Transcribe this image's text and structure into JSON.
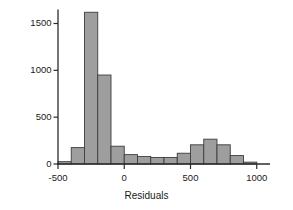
{
  "chart_data": {
    "type": "bar",
    "title": "",
    "xlabel": "Residuals",
    "ylabel": "Frequency",
    "xlim": [
      -500,
      1100
    ],
    "ylim": [
      0,
      1700
    ],
    "grid": false,
    "legend": null,
    "bin_width": 100,
    "bar_color": "#9e9e9e",
    "bar_edge_color": "#3d3d3d",
    "axis_color": "#2b2b2b",
    "xticks": [
      -500,
      0,
      500,
      1000
    ],
    "xtick_labels": [
      "-500",
      "0",
      "500",
      "1000"
    ],
    "yticks": [
      0,
      500,
      1000,
      1500
    ],
    "ytick_labels": [
      "0",
      "500",
      "1000",
      "1500"
    ],
    "bins": [
      {
        "x0": -500,
        "x1": -400,
        "value": 25
      },
      {
        "x0": -400,
        "x1": -300,
        "value": 175
      },
      {
        "x0": -300,
        "x1": -200,
        "value": 1620
      },
      {
        "x0": -200,
        "x1": -100,
        "value": 950
      },
      {
        "x0": -100,
        "x1": 0,
        "value": 190
      },
      {
        "x0": 0,
        "x1": 100,
        "value": 100
      },
      {
        "x0": 100,
        "x1": 200,
        "value": 80
      },
      {
        "x0": 200,
        "x1": 300,
        "value": 70
      },
      {
        "x0": 300,
        "x1": 400,
        "value": 70
      },
      {
        "x0": 400,
        "x1": 500,
        "value": 115
      },
      {
        "x0": 500,
        "x1": 600,
        "value": 205
      },
      {
        "x0": 600,
        "x1": 700,
        "value": 265
      },
      {
        "x0": 700,
        "x1": 800,
        "value": 205
      },
      {
        "x0": 800,
        "x1": 900,
        "value": 90
      },
      {
        "x0": 900,
        "x1": 1000,
        "value": 20
      }
    ]
  }
}
